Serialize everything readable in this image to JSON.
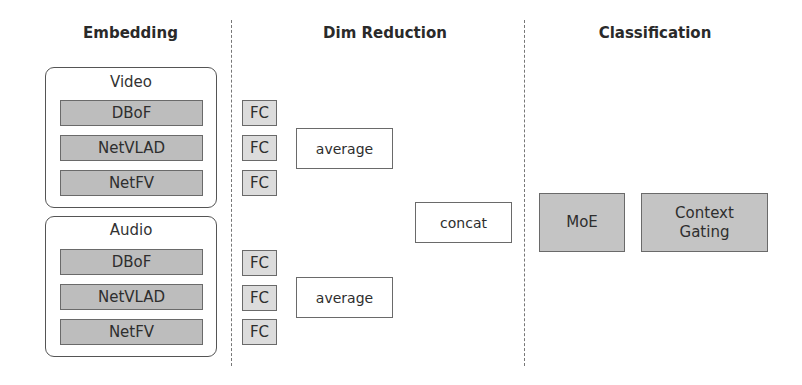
{
  "headers": {
    "embedding": "Embedding",
    "dim_reduction": "Dim Reduction",
    "classification": "Classification"
  },
  "embedding": {
    "groups": [
      {
        "title": "Video",
        "items": [
          "DBoF",
          "NetVLAD",
          "NetFV"
        ]
      },
      {
        "title": "Audio",
        "items": [
          "DBoF",
          "NetVLAD",
          "NetFV"
        ]
      }
    ]
  },
  "dim_reduction": {
    "fc_label": "FC",
    "fc_boxes": [
      "FC",
      "FC",
      "FC",
      "FC",
      "FC",
      "FC"
    ],
    "average_boxes": [
      "average",
      "average"
    ],
    "concat": "concat"
  },
  "classification": {
    "moe": "MoE",
    "context_gating_line1": "Context",
    "context_gating_line2": "Gating"
  },
  "colors": {
    "gray_block": "#bdbdbd",
    "fc_block": "#dcdcdc",
    "classification_block": "#c4c4c4",
    "border": "#6a6a6a"
  }
}
